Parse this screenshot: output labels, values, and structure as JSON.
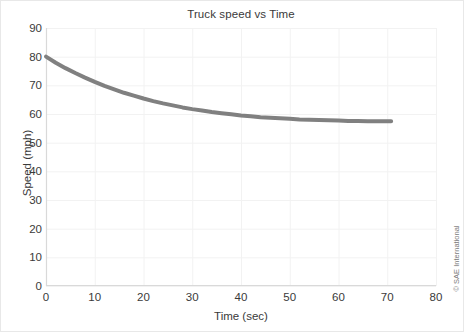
{
  "chart_data": {
    "type": "line",
    "title": "Truck speed vs Time",
    "xlabel": "Time (sec)",
    "ylabel": "Speed (mph)",
    "xlim": [
      0,
      80
    ],
    "ylim": [
      0,
      90
    ],
    "xticks": [
      0,
      10,
      20,
      30,
      40,
      50,
      60,
      70,
      80
    ],
    "yticks": [
      0,
      10,
      20,
      30,
      40,
      50,
      60,
      70,
      80,
      90
    ],
    "grid": true,
    "legend": "none",
    "series": [
      {
        "name": "Truck speed",
        "color": "#808080",
        "line_width_px": 4,
        "x": [
          0,
          2,
          4,
          6,
          8,
          10,
          12,
          14,
          16,
          18,
          20,
          22,
          24,
          26,
          28,
          30,
          32,
          34,
          36,
          38,
          40,
          42,
          44,
          46,
          48,
          50,
          52,
          54,
          56,
          58,
          60,
          62,
          64,
          66,
          68,
          70,
          70.8
        ],
        "values": [
          80.0,
          77.9,
          76.0,
          74.3,
          72.7,
          71.2,
          69.8,
          68.6,
          67.4,
          66.4,
          65.4,
          64.5,
          63.7,
          63.0,
          62.3,
          61.7,
          61.2,
          60.7,
          60.3,
          59.9,
          59.5,
          59.2,
          58.9,
          58.7,
          58.5,
          58.3,
          58.1,
          58.0,
          57.9,
          57.8,
          57.7,
          57.6,
          57.6,
          57.5,
          57.5,
          57.5,
          57.5
        ]
      }
    ]
  },
  "credit": {
    "text": "© SAE International"
  },
  "style": {
    "grid_color": "#f2f2f2",
    "axis_color": "#d9d9d9",
    "text_color": "#3a3a3a",
    "border_color": "#e8e8e8",
    "plot_background": "#ffffff"
  }
}
